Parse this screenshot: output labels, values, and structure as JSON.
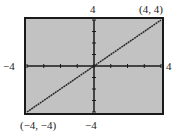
{
  "chart_data": {
    "type": "line",
    "title": "",
    "xlabel": "",
    "ylabel": "",
    "xlim": [
      -4,
      4
    ],
    "ylim": [
      -4,
      4
    ],
    "grid": false,
    "xticks": [
      -4,
      -3,
      -2,
      -1,
      0,
      1,
      2,
      3,
      4
    ],
    "yticks": [
      -4,
      -3,
      -2,
      -1,
      0,
      1,
      2,
      3,
      4
    ],
    "series": [
      {
        "name": "y = x",
        "x": [
          -4,
          4
        ],
        "y": [
          -4,
          4
        ]
      }
    ],
    "annotations": [
      {
        "text": "(4, 4)",
        "x": 4,
        "y": 4
      },
      {
        "text": "(−4, −4)",
        "x": -4,
        "y": -4
      }
    ],
    "window_labels": {
      "xmin": "−4",
      "xmax": "4",
      "ymin": "−4",
      "ymax": "4"
    }
  },
  "colors": {
    "background": "#c2c2c2",
    "frame": "#1a1a1a",
    "axes": "#1a1a1a",
    "line": "#2a2a2a"
  }
}
